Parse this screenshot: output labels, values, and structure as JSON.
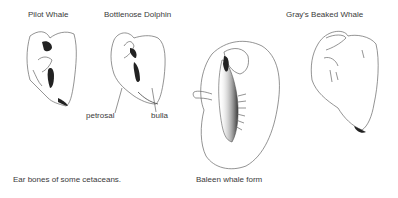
{
  "figure": {
    "caption": "Ear bones of some cetaceans.",
    "specimens": [
      {
        "name": "Pilot Whale"
      },
      {
        "name": "Bottlenose Dolphin"
      },
      {
        "name": "Baleen whale form"
      },
      {
        "name": "Gray's Beaked Whale"
      }
    ],
    "annotations": {
      "petrosal": "petrosal",
      "bulla": "bulla"
    }
  }
}
